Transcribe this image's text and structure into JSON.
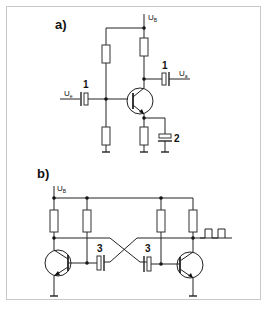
{
  "figure": {
    "panels": [
      {
        "label": "a)",
        "title": "Transistor amplifier stage (common emitter)",
        "supply_label": "U",
        "supply_sub": "B",
        "input_label": "U",
        "input_sub": "e",
        "output_label": "U",
        "output_sub": "a",
        "callouts": [
          "1",
          "1",
          "2"
        ]
      },
      {
        "label": "b)",
        "title": "Astable multivibrator",
        "supply_label": "U",
        "supply_sub": "B",
        "callouts": [
          "3",
          "3"
        ],
        "output_signal": "square-wave"
      }
    ],
    "colors": {
      "line": "#222222",
      "frame": "#c8c8c8",
      "background": "#ffffff"
    }
  }
}
